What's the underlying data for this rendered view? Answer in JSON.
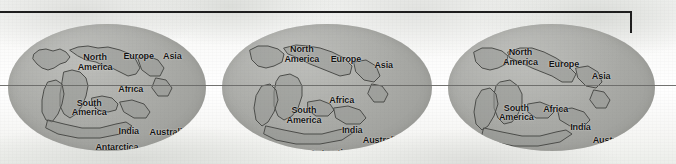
{
  "figure": {
    "background_color": "#f6f6f4",
    "globe_fill": "#a9aaa6",
    "coastline_color": "#4b4c49",
    "label_color": "#121212",
    "rule_color": "#1d1d1d",
    "equator_color": "#6a6a68"
  },
  "bracket": {
    "name": "top-bracket-rule"
  },
  "equator": {
    "name": "equator-line"
  },
  "globes": [
    {
      "id": "globe-1",
      "labels": [
        {
          "text": "North\nAmerica",
          "x": 44,
          "y": 30
        },
        {
          "text": "Europe",
          "x": 66,
          "y": 26
        },
        {
          "text": "Asia",
          "x": 83,
          "y": 26
        },
        {
          "text": "Africa",
          "x": 62,
          "y": 52
        },
        {
          "text": "South\nAmerica",
          "x": 41,
          "y": 66
        },
        {
          "text": "India",
          "x": 61,
          "y": 85
        },
        {
          "text": "Australia",
          "x": 81,
          "y": 86
        },
        {
          "text": "Antarctica",
          "x": 55,
          "y": 98
        }
      ]
    },
    {
      "id": "globe-2",
      "labels": [
        {
          "text": "North\nAmerica",
          "x": 38,
          "y": 24
        },
        {
          "text": "Europe",
          "x": 59,
          "y": 28
        },
        {
          "text": "Asia",
          "x": 77,
          "y": 33
        },
        {
          "text": "Africa",
          "x": 57,
          "y": 61
        },
        {
          "text": "South\nAmerica",
          "x": 39,
          "y": 72
        },
        {
          "text": "India",
          "x": 62,
          "y": 84
        },
        {
          "text": "Australia",
          "x": 76,
          "y": 92
        },
        {
          "text": "Antarctica",
          "x": 52,
          "y": 102
        }
      ]
    },
    {
      "id": "globe-3",
      "labels": [
        {
          "text": "North\nAmerica",
          "x": 35,
          "y": 26
        },
        {
          "text": "Europe",
          "x": 56,
          "y": 32
        },
        {
          "text": "Asia",
          "x": 74,
          "y": 42
        },
        {
          "text": "South\nAmerica",
          "x": 33,
          "y": 70
        },
        {
          "text": "Africa",
          "x": 52,
          "y": 68
        },
        {
          "text": "India",
          "x": 64,
          "y": 82
        },
        {
          "text": "Australia",
          "x": 79,
          "y": 92
        },
        {
          "text": "Antarctica",
          "x": 44,
          "y": 104
        }
      ]
    }
  ],
  "coastlines": {
    "globe1": [
      "M 26 30 L 31 26 L 38 25 L 45 27 L 52 25 L 58 28 L 62 33 L 58 38 L 52 40 L 46 44 L 40 46 L 34 44 L 29 40 L 25 35 Z",
      "M 62 26 L 70 23 L 80 22 L 90 24 L 100 23 L 112 26 L 122 30 L 128 36 L 132 44 L 128 50 L 120 52 L 112 48 L 104 44 L 96 42 L 88 38 L 78 36 L 70 32 Z",
      "M 56 48 L 64 46 L 72 48 L 78 54 L 80 62 L 78 72 L 74 82 L 68 90 L 62 94 L 56 90 L 52 82 L 52 70 L 54 58 Z",
      "M 40 58 L 48 56 L 54 60 L 56 70 L 54 80 L 50 90 L 44 98 L 38 96 L 34 88 L 34 76 L 36 66 Z",
      "M 84 74 L 94 72 L 104 74 L 110 80 L 108 86 L 100 88 L 90 86 L 84 80 Z",
      "M 112 78 L 124 76 L 136 80 L 142 88 L 138 94 L 126 94 L 116 88 Z",
      "M 40 96 L 56 100 L 74 104 L 92 104 L 108 100 L 118 98 L 124 102 L 112 110 L 92 114 L 70 114 L 50 110 L 38 104 Z",
      "M 130 34 L 140 32 L 150 36 L 156 44 L 152 52 L 142 52 L 134 46 Z",
      "M 148 54 L 158 56 L 164 64 L 160 72 L 150 72 L 144 64 Z"
    ],
    "globe2": [
      "M 28 26 L 36 22 L 46 22 L 56 25 L 62 30 L 60 38 L 52 42 L 44 44 L 36 42 L 30 36 Z",
      "M 62 24 L 74 21 L 86 22 L 98 24 L 110 28 L 122 34 L 130 42 L 128 50 L 118 52 L 108 48 L 98 44 L 88 40 L 76 34 L 66 30 Z",
      "M 58 52 L 68 50 L 76 54 L 80 62 L 80 72 L 76 84 L 70 92 L 62 96 L 56 92 L 52 82 L 52 68 L 54 58 Z",
      "M 40 62 L 48 60 L 54 66 L 56 76 L 52 88 L 46 98 L 40 102 L 34 96 L 32 84 L 34 72 Z",
      "M 86 78 L 98 76 L 108 80 L 112 86 L 106 92 L 94 92 L 86 86 Z",
      "M 112 84 L 126 82 L 138 86 L 144 94 L 138 100 L 124 100 L 114 94 Z",
      "M 44 102 L 62 106 L 82 110 L 100 110 L 116 106 L 126 104 L 132 108 L 120 116 L 98 120 L 74 120 L 54 116 L 42 110 Z",
      "M 132 38 L 144 36 L 154 42 L 158 52 L 152 58 L 142 56 L 134 48 Z",
      "M 150 60 L 160 62 L 166 70 L 162 78 L 152 78 L 146 70 Z"
    ],
    "globe3": [
      "M 26 28 L 34 24 L 44 24 L 54 27 L 60 32 L 58 40 L 50 44 L 42 46 L 34 44 L 28 38 Z",
      "M 60 28 L 72 24 L 84 24 L 96 28 L 108 34 L 120 42 L 128 50 L 124 58 L 114 58 L 104 52 L 94 48 L 84 44 L 72 38 L 62 34 Z",
      "M 52 58 L 62 56 L 70 62 L 74 70 L 74 80 L 70 90 L 64 98 L 56 100 L 50 94 L 46 84 L 46 70 L 48 62 Z",
      "M 34 66 L 42 64 L 48 70 L 50 80 L 46 92 L 40 102 L 34 106 L 28 100 L 26 88 L 28 76 Z",
      "M 80 80 L 92 78 L 102 82 L 106 88 L 100 94 L 88 94 L 80 88 Z",
      "M 110 86 L 124 84 L 136 88 L 142 96 L 136 102 L 122 102 L 112 96 Z",
      "M 36 104 L 54 108 L 74 112 L 92 112 L 108 108 L 118 106 L 124 110 L 112 118 L 90 122 L 66 122 L 46 118 L 34 112 Z",
      "M 128 44 L 140 42 L 150 48 L 154 58 L 148 64 L 138 62 L 130 54 Z",
      "M 146 66 L 156 68 L 162 76 L 158 84 L 148 84 L 142 76 Z"
    ]
  }
}
